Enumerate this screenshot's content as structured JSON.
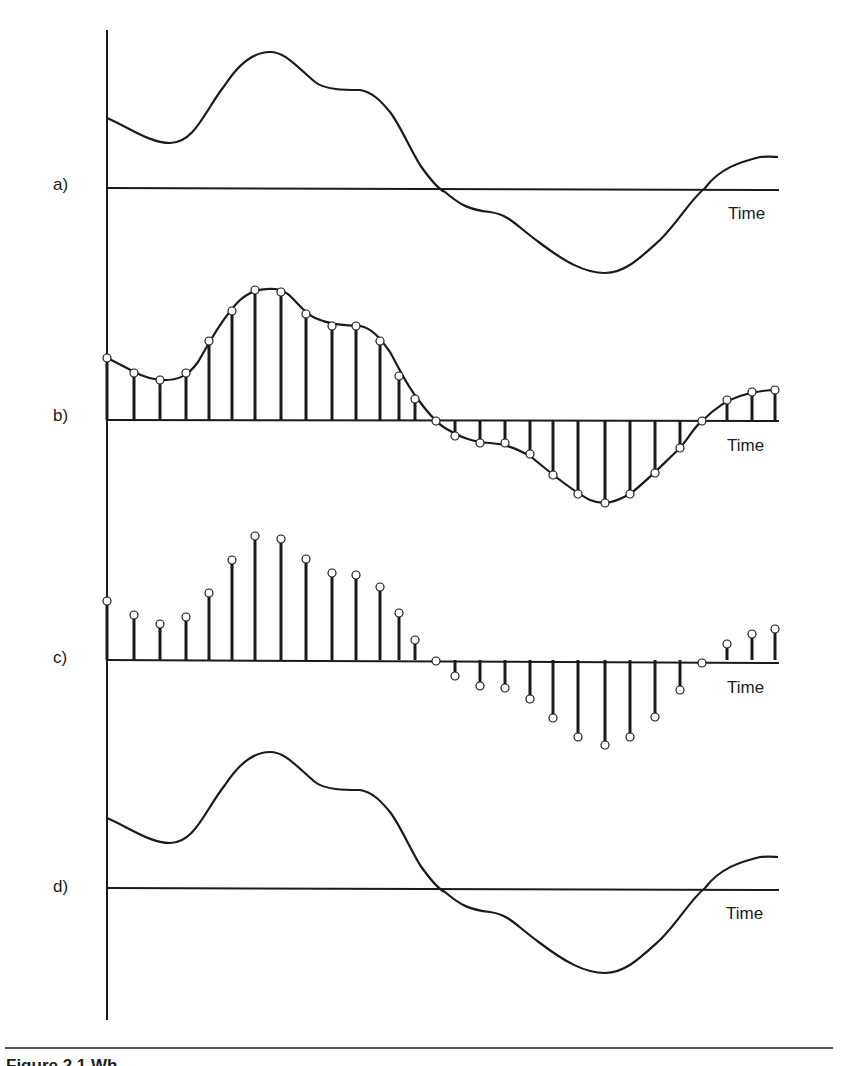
{
  "figure": {
    "caption_visible": "Figure 2.1   Wh",
    "axis": {
      "x": 107,
      "y_top": 30,
      "y_bottom": 1020
    },
    "line_color": "#1a1a1a",
    "panels": [
      {
        "id": "a",
        "label": "a)",
        "kind": "continuous",
        "baseline_y": 188,
        "time_label": "Time",
        "description": "Original continuous analog waveform"
      },
      {
        "id": "b",
        "label": "b)",
        "kind": "sampled-with-curve",
        "baseline_y": 420,
        "time_label": "Time",
        "description": "Waveform sampled at regular intervals (stems with sample points on curve)"
      },
      {
        "id": "c",
        "label": "c)",
        "kind": "discrete-samples",
        "baseline_y": 660,
        "time_label": "Time",
        "description": "Discrete sample values only (stems with circles)"
      },
      {
        "id": "d",
        "label": "d)",
        "kind": "continuous",
        "baseline_y": 888,
        "time_label": "Time",
        "description": "Reconstructed continuous waveform"
      }
    ],
    "sample_x": [
      107,
      134,
      160,
      186,
      209,
      232,
      255,
      281,
      306,
      332,
      356,
      380,
      399,
      415,
      436,
      455,
      480,
      505,
      530,
      553,
      578,
      605,
      630,
      655,
      680,
      702,
      727,
      752,
      775
    ],
    "samples_b_y": [
      358,
      373,
      380,
      373,
      341,
      311,
      290,
      292,
      314,
      326,
      326,
      341,
      376,
      399,
      421,
      436,
      443,
      443,
      454,
      475,
      494,
      503,
      494,
      473,
      448,
      421,
      400,
      392,
      390
    ],
    "samples_c_y": [
      601,
      615,
      624,
      617,
      593,
      560,
      536,
      539,
      559,
      573,
      575,
      587,
      613,
      640,
      661,
      676,
      686,
      688,
      699,
      718,
      737,
      745,
      737,
      717,
      690,
      663,
      644,
      634,
      629
    ]
  },
  "chart_data": {
    "type": "line",
    "title": "",
    "xlabel": "Time",
    "ylabel": "",
    "panels": [
      "a) continuous signal",
      "b) sampled signal with envelope",
      "c) discrete samples",
      "d) reconstructed signal"
    ],
    "x": [
      0,
      1,
      2,
      3,
      4,
      5,
      6,
      7,
      8,
      9,
      10,
      11,
      12,
      13,
      14,
      15,
      16,
      17,
      18,
      19,
      20,
      21,
      22,
      23,
      24,
      25,
      26,
      27,
      28
    ],
    "series": [
      {
        "name": "sample amplitude (relative, baseline=0)",
        "values": [
          62,
          47,
          40,
          47,
          79,
          109,
          130,
          128,
          106,
          94,
          94,
          79,
          44,
          21,
          -1,
          -16,
          -23,
          -23,
          -34,
          -55,
          -74,
          -83,
          -74,
          -53,
          -28,
          -1,
          20,
          28,
          30
        ]
      }
    ]
  }
}
